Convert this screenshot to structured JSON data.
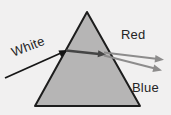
{
  "labels": {
    "incident_ray": "White",
    "top_ray": "Red",
    "bottom_ray": "Blue"
  },
  "colors": {
    "background": "#f1f0f0",
    "prism_fill": "#b6b5b5",
    "prism_stroke": "#1d1d1d",
    "incident_ray": "#161616",
    "internal_beam": "#454545",
    "dispersed_ray": "#8d8c8c",
    "label_text": "#242424"
  }
}
